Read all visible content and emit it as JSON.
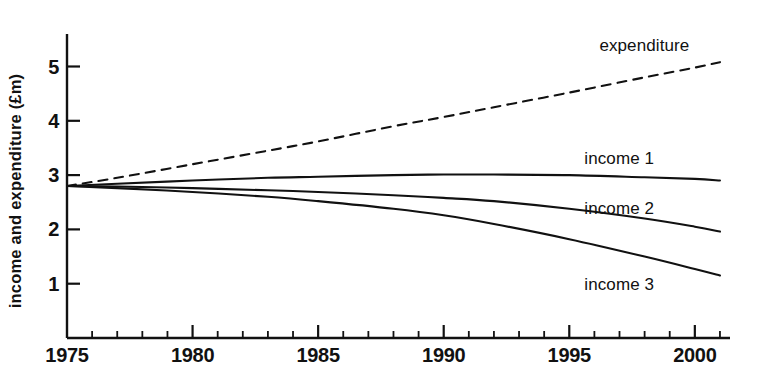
{
  "chart_data": {
    "type": "line",
    "title": "",
    "xlabel": "",
    "ylabel": "income and expenditure (£m)",
    "xlim": [
      1975,
      2001.4
    ],
    "ylim": [
      0,
      5.6
    ],
    "xticks_major": [
      1975,
      1980,
      1985,
      1990,
      1995,
      2000
    ],
    "xticklabels": [
      "1975",
      "1980",
      "1985",
      "1990",
      "1995",
      "2000"
    ],
    "xticks_minor_step": 1,
    "yticks": [
      1,
      2,
      3,
      4,
      5
    ],
    "yticklabels": [
      "1",
      "2",
      "3",
      "4",
      "5"
    ],
    "grid": false,
    "legend": "inline-labels-right",
    "x": [
      1975,
      1977,
      1980,
      1983,
      1985,
      1988,
      1990,
      1992,
      1995,
      1998,
      2000,
      2001
    ],
    "series": [
      {
        "name": "expenditure",
        "style": "dashed",
        "color": "#111111",
        "label": "expenditure",
        "label_x": 1996.2,
        "label_y": 5.35,
        "values": [
          2.8,
          2.95,
          3.2,
          3.45,
          3.62,
          3.9,
          4.07,
          4.25,
          4.52,
          4.8,
          4.98,
          5.08
        ]
      },
      {
        "name": "income 1",
        "style": "solid",
        "color": "#111111",
        "label": "income 1",
        "label_x": 1995.6,
        "label_y": 3.28,
        "values": [
          2.8,
          2.84,
          2.9,
          2.95,
          2.97,
          3.0,
          3.01,
          3.01,
          3.0,
          2.96,
          2.93,
          2.9
        ]
      },
      {
        "name": "income 2",
        "style": "solid",
        "color": "#111111",
        "label": "income 2",
        "label_x": 1995.6,
        "label_y": 2.36,
        "values": [
          2.8,
          2.79,
          2.76,
          2.72,
          2.69,
          2.63,
          2.58,
          2.52,
          2.38,
          2.2,
          2.05,
          1.96
        ]
      },
      {
        "name": "income 3",
        "style": "solid",
        "color": "#111111",
        "label": "income 3",
        "label_x": 1995.6,
        "label_y": 0.95,
        "values": [
          2.8,
          2.76,
          2.69,
          2.6,
          2.52,
          2.38,
          2.26,
          2.1,
          1.82,
          1.5,
          1.27,
          1.15
        ]
      }
    ]
  }
}
